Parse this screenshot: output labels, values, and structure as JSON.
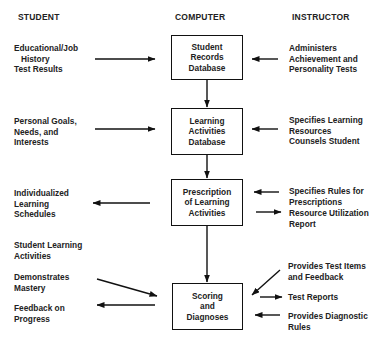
{
  "headers": {
    "student": "STUDENT",
    "computer": "COMPUTER",
    "instructor": "INSTRUCTOR"
  },
  "computer_boxes": [
    {
      "label": "Student\nRecords\nDatabase"
    },
    {
      "label": "Learning\nActivities\nDatabase"
    },
    {
      "label": "Prescription\nof Learning\nActivities"
    },
    {
      "label": "Scoring\nand\nDiagnoses"
    }
  ],
  "student_items": [
    {
      "label": "Educational/Job\n   History\nTest Results",
      "direction": "to-computer"
    },
    {
      "label": "Personal Goals,\nNeeds, and\nInterests",
      "direction": "to-computer"
    },
    {
      "label": "Individualized\nLearning\nSchedules",
      "direction": "from-computer"
    },
    {
      "label": "Student Learning\nActivities",
      "direction": "none"
    },
    {
      "label": "Demonstrates\nMastery",
      "direction": "to-computer"
    },
    {
      "label": "Feedback on\nProgress",
      "direction": "from-computer"
    }
  ],
  "instructor_items": [
    {
      "label": "Administers\nAchievement and\nPersonality Tests",
      "direction": "to-computer"
    },
    {
      "label": "Specifies Learning\nResources\nCounsels Student",
      "direction": "to-computer"
    },
    {
      "label": "Specifies Rules for\nPrescriptions",
      "direction": "to-computer"
    },
    {
      "label": "Resource Utilization\nReport",
      "direction": "from-computer"
    },
    {
      "label": "Provides Test Items\nand Feedback",
      "direction": "to-computer"
    },
    {
      "label": "Test Reports",
      "direction": "from-computer"
    },
    {
      "label": "Provides Diagnostic\nRules",
      "direction": "to-computer"
    }
  ]
}
